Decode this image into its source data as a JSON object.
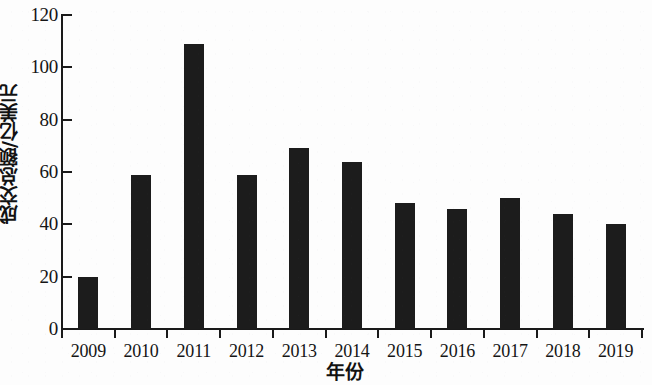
{
  "chart_data": {
    "type": "bar",
    "title": "",
    "xlabel": "年份",
    "ylabel": "成交总额/亿美元",
    "categories": [
      "2009",
      "2010",
      "2011",
      "2012",
      "2013",
      "2014",
      "2015",
      "2016",
      "2017",
      "2018",
      "2019"
    ],
    "values": [
      20,
      59,
      109,
      59,
      69,
      64,
      48,
      46,
      50,
      44,
      40
    ],
    "ylim": [
      0,
      120
    ],
    "ytick_values": [
      0,
      20,
      40,
      60,
      80,
      100,
      120
    ],
    "ytick_labels": [
      "0",
      "20",
      "40",
      "60",
      "80",
      "100",
      "120"
    ],
    "grid": false,
    "legend": null,
    "bar_color": "#1c1c1c",
    "axis_color": "#1a1a1a",
    "background_color": "#fdfdfd"
  },
  "axes": {
    "y_title": "成交总额/亿美元",
    "x_title": "年份"
  }
}
